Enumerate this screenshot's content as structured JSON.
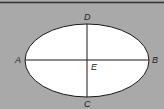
{
  "figure": {
    "background": "#a9a9a9",
    "ellipse_fill": "#ffffff",
    "stroke": "#1a1a1a",
    "labels": {
      "A": "A",
      "B": "B",
      "C": "C",
      "D": "D",
      "E": "E"
    }
  }
}
